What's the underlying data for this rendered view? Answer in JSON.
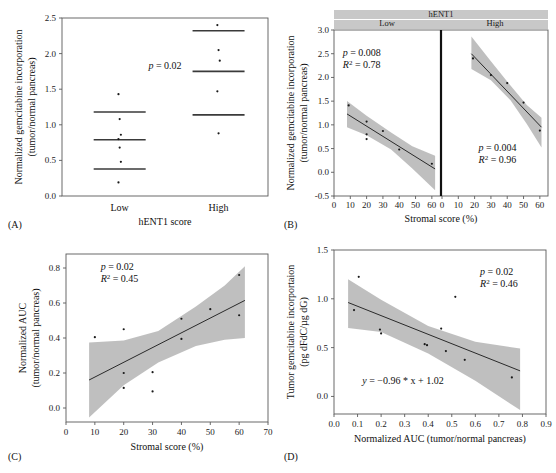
{
  "figure": {
    "panel_letters": [
      "(A)",
      "(B)",
      "(C)",
      "(D)"
    ]
  },
  "chart_data": [
    {
      "panel": "A",
      "type": "scatter",
      "title": "",
      "xlabel": "hENT1 score",
      "ylabel": "Normalized gemcitabine incorporation\n(tumor/normal pancreas)",
      "ylabel_line1": "Normalized gemcitabine incorporation",
      "ylabel_line2": "(tumor/normal pancreas)",
      "categories": [
        "Low",
        "High"
      ],
      "ylim": [
        0.0,
        2.5
      ],
      "yticks": [
        0.0,
        0.5,
        1.0,
        1.5,
        2.0,
        2.5
      ],
      "yticklabels": [
        "0.0",
        "0.5",
        "1.0",
        "1.5",
        "2.0",
        "2.5"
      ],
      "grid": false,
      "annotations": [
        {
          "text": "p = 0.02",
          "italic_prefix": "p",
          "rest": " = 0.02",
          "x_frac": 0.5,
          "y_value": 1.78
        }
      ],
      "groups": [
        {
          "name": "Low",
          "x_frac": 0.28,
          "points": [
            1.43,
            1.08,
            0.86,
            0.8,
            0.68,
            0.48,
            0.19
          ],
          "reference_lines": [
            1.18,
            0.79,
            0.38
          ]
        },
        {
          "name": "High",
          "x_frac": 0.76,
          "points": [
            2.4,
            2.05,
            1.9,
            1.47,
            0.88
          ],
          "reference_lines": [
            2.32,
            1.75,
            1.14
          ]
        }
      ]
    },
    {
      "panel": "B",
      "type": "scatter",
      "strip_title": "hENT1",
      "xlabel": "Stromal score (%)",
      "ylabel_line1": "Normalized gemcitabine incorporation",
      "ylabel_line2": "(tumor/normal pancreas)",
      "ylim": [
        -0.5,
        3.0
      ],
      "yticks": [
        -0.5,
        0.0,
        0.5,
        1.0,
        1.5,
        2.0,
        2.5,
        3.0
      ],
      "yticklabels": [
        "-0.5",
        "0.0",
        "0.5",
        "1.0",
        "1.5",
        "2.0",
        "2.5",
        "3.0"
      ],
      "xlim": [
        0,
        65
      ],
      "xticks": [
        0,
        10,
        20,
        30,
        40,
        50,
        60
      ],
      "xticklabels": [
        "0",
        "10",
        "20",
        "30",
        "40",
        "50",
        "60"
      ],
      "grid": false,
      "subpanels": [
        {
          "strip_label": "Low",
          "stats": {
            "p_label": "p",
            "p_text": " = 0.008",
            "r2_label": "R",
            "r2_sup": "2",
            "r2_text": " = 0.78"
          },
          "stats_pos": {
            "x_value": 17,
            "y_value": 2.45
          },
          "points": [
            {
              "x": 9,
              "y": 1.41
            },
            {
              "x": 20,
              "y": 1.07
            },
            {
              "x": 20,
              "y": 0.8
            },
            {
              "x": 20,
              "y": 0.7
            },
            {
              "x": 30,
              "y": 0.87
            },
            {
              "x": 40,
              "y": 0.48
            },
            {
              "x": 60,
              "y": 0.18
            }
          ],
          "fit": {
            "x0": 8,
            "y0": 1.23,
            "x1": 62,
            "y1": 0.07
          },
          "ci_upper": [
            {
              "x": 8,
              "y": 1.5
            },
            {
              "x": 20,
              "y": 1.19
            },
            {
              "x": 35,
              "y": 0.84
            },
            {
              "x": 48,
              "y": 0.55
            },
            {
              "x": 62,
              "y": 0.35
            }
          ],
          "ci_lower": [
            {
              "x": 8,
              "y": 0.95
            },
            {
              "x": 20,
              "y": 0.78
            },
            {
              "x": 35,
              "y": 0.48
            },
            {
              "x": 48,
              "y": 0.08
            },
            {
              "x": 62,
              "y": -0.38
            }
          ]
        },
        {
          "strip_label": "High",
          "stats": {
            "p_label": "p",
            "p_text": " = 0.004",
            "r2_label": "R",
            "r2_sup": "2",
            "r2_text": " = 0.96"
          },
          "stats_pos": {
            "x_value": 34,
            "y_value": 0.45
          },
          "points": [
            {
              "x": 19,
              "y": 2.4
            },
            {
              "x": 30,
              "y": 2.05
            },
            {
              "x": 40,
              "y": 1.88
            },
            {
              "x": 50,
              "y": 1.47
            },
            {
              "x": 60,
              "y": 0.88
            }
          ],
          "fit": {
            "x0": 18,
            "y0": 2.5,
            "x1": 61,
            "y1": 0.95
          },
          "ci_upper": [
            {
              "x": 18,
              "y": 2.86
            },
            {
              "x": 30,
              "y": 2.34
            },
            {
              "x": 42,
              "y": 1.83
            },
            {
              "x": 52,
              "y": 1.42
            },
            {
              "x": 61,
              "y": 1.15
            }
          ],
          "ci_lower": [
            {
              "x": 18,
              "y": 2.18
            },
            {
              "x": 30,
              "y": 1.94
            },
            {
              "x": 42,
              "y": 1.52
            },
            {
              "x": 52,
              "y": 1.02
            },
            {
              "x": 61,
              "y": 0.52
            }
          ]
        }
      ]
    },
    {
      "panel": "C",
      "type": "scatter",
      "xlabel": "Stromal score (%)",
      "ylabel_line1": "Normalized AUC",
      "ylabel_line2": "(tumor/normal pancreas)",
      "xlim": [
        0,
        70
      ],
      "xticks": [
        0,
        10,
        20,
        30,
        40,
        50,
        60,
        70
      ],
      "xticklabels": [
        "0",
        "10",
        "20",
        "30",
        "40",
        "50",
        "60",
        "70"
      ],
      "ylim": [
        -0.08,
        0.88
      ],
      "yticks": [
        0.0,
        0.2,
        0.4,
        0.6,
        0.8
      ],
      "yticklabels": [
        "0.0",
        "0.2",
        "0.4",
        "0.6",
        "0.8"
      ],
      "grid": false,
      "stats": {
        "p_label": "p",
        "p_text": " = 0.02",
        "r2_label": "R",
        "r2_sup": "2",
        "r2_text": " = 0.45"
      },
      "stats_pos": {
        "x_value": 12,
        "y_value": 0.79
      },
      "points": [
        {
          "x": 10,
          "y": 0.405
        },
        {
          "x": 20,
          "y": 0.45
        },
        {
          "x": 20,
          "y": 0.2
        },
        {
          "x": 20,
          "y": 0.115
        },
        {
          "x": 30,
          "y": 0.205
        },
        {
          "x": 30,
          "y": 0.095
        },
        {
          "x": 40,
          "y": 0.51
        },
        {
          "x": 40,
          "y": 0.395
        },
        {
          "x": 50,
          "y": 0.565
        },
        {
          "x": 60,
          "y": 0.76
        },
        {
          "x": 60,
          "y": 0.53
        }
      ],
      "fit": {
        "x0": 8,
        "y0": 0.16,
        "x1": 62,
        "y1": 0.615
      },
      "ci_upper": [
        {
          "x": 8,
          "y": 0.375
        },
        {
          "x": 20,
          "y": 0.385
        },
        {
          "x": 32,
          "y": 0.44
        },
        {
          "x": 45,
          "y": 0.58
        },
        {
          "x": 55,
          "y": 0.7
        },
        {
          "x": 62,
          "y": 0.81
        }
      ],
      "ci_lower": [
        {
          "x": 8,
          "y": -0.055
        },
        {
          "x": 20,
          "y": 0.13
        },
        {
          "x": 32,
          "y": 0.26
        },
        {
          "x": 45,
          "y": 0.355
        },
        {
          "x": 55,
          "y": 0.39
        },
        {
          "x": 62,
          "y": 0.4
        }
      ]
    },
    {
      "panel": "D",
      "type": "scatter",
      "xlabel": "Normalized AUC (tumor/normal pancreas)",
      "ylabel_line1": "Tumor gemcitabine incorportaion",
      "ylabel_line2": "(pg dFdC/µg dG)",
      "xlim": [
        0.0,
        0.9
      ],
      "xticks": [
        0.0,
        0.1,
        0.2,
        0.3,
        0.4,
        0.5,
        0.6,
        0.7,
        0.8,
        0.9
      ],
      "xticklabels": [
        "0.0",
        "0.1",
        "0.2",
        "0.3",
        "0.4",
        "0.5",
        "0.6",
        "0.7",
        "0.8",
        "0.9"
      ],
      "ylim": [
        -0.18,
        1.5
      ],
      "yticks": [
        0.0,
        0.5,
        1.0,
        1.5
      ],
      "yticklabels": [
        "0.0",
        "0.5",
        "1.0",
        "1.5"
      ],
      "grid": false,
      "stats": {
        "p_label": "p",
        "p_text": " = 0.02",
        "r2_label": "R",
        "r2_sup": "2",
        "r2_text": " = 0.46"
      },
      "stats_pos": {
        "x_value": 0.62,
        "y_value": 1.24
      },
      "equation": {
        "prefix": "y",
        "text": " = −0.96 * x + 1.02"
      },
      "equation_pos": {
        "x_value": 0.12,
        "y_value": 0.13
      },
      "points": [
        {
          "x": 0.085,
          "y": 0.885
        },
        {
          "x": 0.105,
          "y": 1.225
        },
        {
          "x": 0.195,
          "y": 0.685
        },
        {
          "x": 0.2,
          "y": 0.645
        },
        {
          "x": 0.385,
          "y": 0.535
        },
        {
          "x": 0.395,
          "y": 0.525
        },
        {
          "x": 0.455,
          "y": 0.695
        },
        {
          "x": 0.475,
          "y": 0.465
        },
        {
          "x": 0.515,
          "y": 1.02
        },
        {
          "x": 0.555,
          "y": 0.375
        },
        {
          "x": 0.755,
          "y": 0.195
        }
      ],
      "fit": {
        "x0": 0.06,
        "y0": 0.962,
        "x1": 0.79,
        "y1": 0.262
      },
      "ci_upper": [
        {
          "x": 0.06,
          "y": 1.2
        },
        {
          "x": 0.2,
          "y": 0.99
        },
        {
          "x": 0.4,
          "y": 0.72
        },
        {
          "x": 0.6,
          "y": 0.56
        },
        {
          "x": 0.79,
          "y": 0.49
        }
      ],
      "ci_lower": [
        {
          "x": 0.06,
          "y": 0.7
        },
        {
          "x": 0.2,
          "y": 0.66
        },
        {
          "x": 0.4,
          "y": 0.44
        },
        {
          "x": 0.6,
          "y": 0.16
        },
        {
          "x": 0.79,
          "y": -0.14
        }
      ]
    }
  ]
}
